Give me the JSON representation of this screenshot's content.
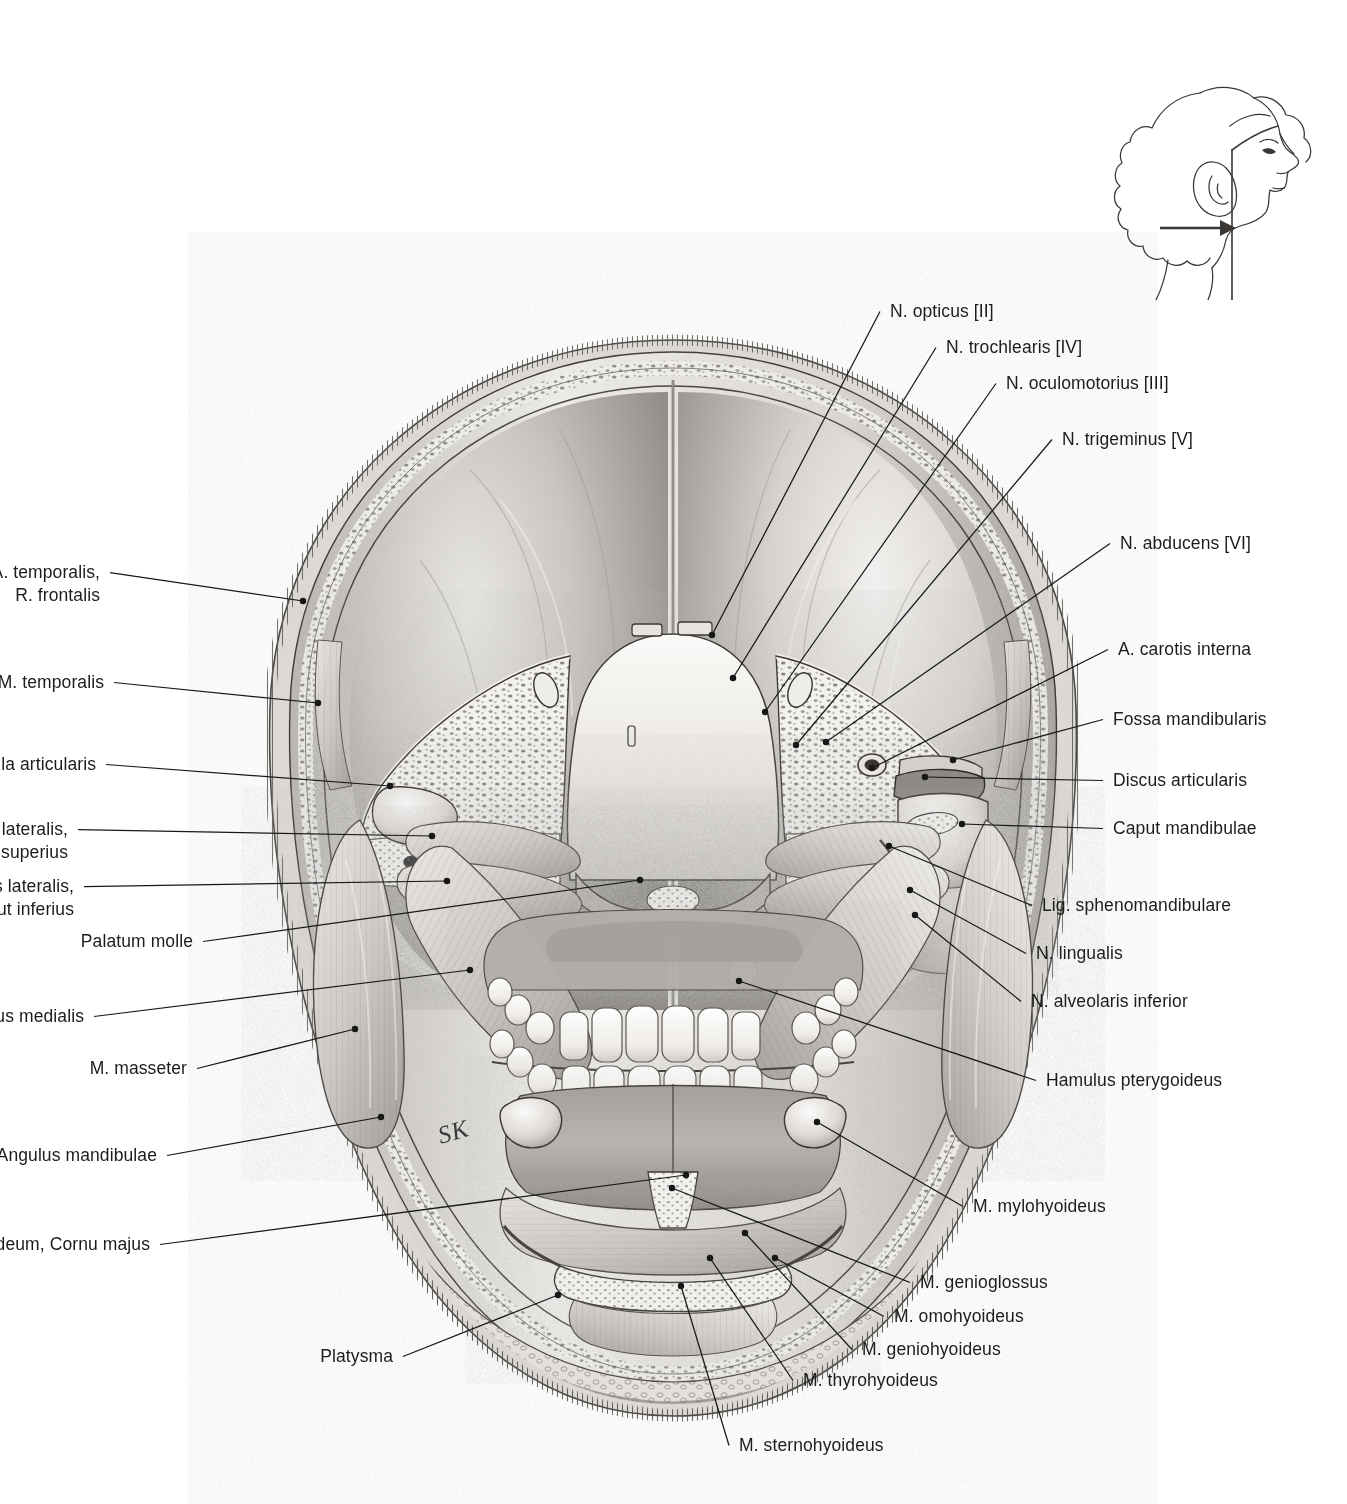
{
  "plate": {
    "title": "Coronal section of the head at the level of the mandibular joints",
    "signature": "SK",
    "orientation_inset": {
      "name": "head-profile-section-indicator",
      "description": "Lateral head outline with vertical coronal section plane and arrow showing viewing direction"
    }
  },
  "labels_left": [
    {
      "id": "a-temporalis-r-frontalis",
      "text": "A. temporalis,\nR. frontalis",
      "x": 100,
      "y": 561,
      "anchor_x": 303,
      "anchor_y": 601
    },
    {
      "id": "m-temporalis",
      "text": "M. temporalis",
      "x": 104,
      "y": 671,
      "anchor_x": 318,
      "anchor_y": 703
    },
    {
      "id": "capsula-articularis",
      "text": "Capsula articularis",
      "x": 96,
      "y": 753,
      "anchor_x": 390,
      "anchor_y": 786
    },
    {
      "id": "m-pterygoideus-lateralis-caput-superius",
      "text": "M. pterygoideus lateralis,\nCaput superius",
      "x": 68,
      "y": 818,
      "anchor_x": 432,
      "anchor_y": 836
    },
    {
      "id": "m-pterygoideus-lateralis-caput-inferius",
      "text": "M. pterygoideus lateralis,\nCaput inferius",
      "x": 74,
      "y": 875,
      "anchor_x": 447,
      "anchor_y": 881
    },
    {
      "id": "palatum-molle",
      "text": "Palatum molle",
      "x": 193,
      "y": 930,
      "anchor_x": 640,
      "anchor_y": 880
    },
    {
      "id": "m-pterygoideus-medialis",
      "text": "M. pterygoideus medialis",
      "x": 84,
      "y": 1005,
      "anchor_x": 470,
      "anchor_y": 970
    },
    {
      "id": "m-masseter",
      "text": "M. masseter",
      "x": 187,
      "y": 1057,
      "anchor_x": 355,
      "anchor_y": 1029
    },
    {
      "id": "angulus-mandibulae",
      "text": "Angulus mandibulae",
      "x": 157,
      "y": 1144,
      "anchor_x": 381,
      "anchor_y": 1117
    },
    {
      "id": "os-hyoideum-cornu-majus",
      "text": "Os hyoideum, Cornu majus",
      "x": 150,
      "y": 1233,
      "anchor_x": 686,
      "anchor_y": 1175
    },
    {
      "id": "platysma",
      "text": "Platysma",
      "x": 393,
      "y": 1345,
      "anchor_x": 558,
      "anchor_y": 1295
    }
  ],
  "labels_right_upper": [
    {
      "id": "n-opticus-ii",
      "text": "N. opticus [II]",
      "x": 890,
      "y": 300,
      "anchor_x": 712,
      "anchor_y": 635
    },
    {
      "id": "n-trochlearis-iv",
      "text": "N. trochlearis [IV]",
      "x": 946,
      "y": 336,
      "anchor_x": 733,
      "anchor_y": 678
    },
    {
      "id": "n-oculomotorius-iii",
      "text": "N. oculomotorius [III]",
      "x": 1006,
      "y": 372,
      "anchor_x": 765,
      "anchor_y": 712
    },
    {
      "id": "n-trigeminus-v",
      "text": "N. trigeminus [V]",
      "x": 1062,
      "y": 428,
      "anchor_x": 796,
      "anchor_y": 745
    },
    {
      "id": "n-abducens-vi",
      "text": "N. abducens [VI]",
      "x": 1120,
      "y": 532,
      "anchor_x": 826,
      "anchor_y": 742
    },
    {
      "id": "a-carotis-interna",
      "text": "A. carotis interna",
      "x": 1118,
      "y": 638,
      "anchor_x": 872,
      "anchor_y": 768
    },
    {
      "id": "fossa-mandibularis",
      "text": "Fossa mandibularis",
      "x": 1113,
      "y": 708,
      "anchor_x": 953,
      "anchor_y": 760
    },
    {
      "id": "discus-articularis",
      "text": "Discus articularis",
      "x": 1113,
      "y": 769,
      "anchor_x": 925,
      "anchor_y": 777
    },
    {
      "id": "caput-mandibulae",
      "text": "Caput mandibulae",
      "x": 1113,
      "y": 817,
      "anchor_x": 962,
      "anchor_y": 824
    }
  ],
  "labels_right_lower": [
    {
      "id": "lig-sphenomandibulare",
      "text": "Lig. sphenomandibulare",
      "x": 1042,
      "y": 894,
      "anchor_x": 889,
      "anchor_y": 846
    },
    {
      "id": "n-lingualis",
      "text": "N. lingualis",
      "x": 1036,
      "y": 942,
      "anchor_x": 910,
      "anchor_y": 890
    },
    {
      "id": "n-alveolaris-inferior",
      "text": "N. alveolaris inferior",
      "x": 1031,
      "y": 990,
      "anchor_x": 915,
      "anchor_y": 915
    },
    {
      "id": "hamulus-pterygoideus",
      "text": "Hamulus pterygoideus",
      "x": 1046,
      "y": 1069,
      "anchor_x": 739,
      "anchor_y": 981
    },
    {
      "id": "m-mylohyoideus",
      "text": "M. mylohyoideus",
      "x": 973,
      "y": 1195,
      "anchor_x": 817,
      "anchor_y": 1122
    },
    {
      "id": "m-genioglossus",
      "text": "M. genioglossus",
      "x": 920,
      "y": 1271,
      "anchor_x": 672,
      "anchor_y": 1188
    },
    {
      "id": "m-omohyoideus",
      "text": "M. omohyoideus",
      "x": 894,
      "y": 1305,
      "anchor_x": 775,
      "anchor_y": 1258
    },
    {
      "id": "m-geniohyoideus",
      "text": "M. geniohyoideus",
      "x": 862,
      "y": 1338,
      "anchor_x": 745,
      "anchor_y": 1233
    },
    {
      "id": "m-thyrohyoideus",
      "text": "M. thyrohyoideus",
      "x": 803,
      "y": 1369,
      "anchor_x": 710,
      "anchor_y": 1258
    },
    {
      "id": "m-sternohyoideus",
      "text": "M. sternohyoideus",
      "x": 739,
      "y": 1434,
      "anchor_x": 681,
      "anchor_y": 1286
    }
  ]
}
